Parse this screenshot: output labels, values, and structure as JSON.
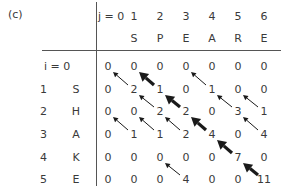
{
  "figure": {
    "panel_label": "(c)",
    "column_index_header": [
      "j = 0",
      "1",
      "2",
      "3",
      "4",
      "5",
      "6"
    ],
    "column_letters": [
      "",
      "S",
      "P",
      "E",
      "A",
      "R",
      "E"
    ],
    "row_index_labels": [
      "i = 0",
      "1",
      "2",
      "3",
      "4",
      "5"
    ],
    "row_letters": [
      "",
      "S",
      "H",
      "A",
      "K",
      "E"
    ],
    "matrix": [
      [
        0,
        0,
        0,
        0,
        0,
        0,
        0
      ],
      [
        0,
        2,
        1,
        0,
        1,
        0,
        0
      ],
      [
        0,
        0,
        2,
        2,
        0,
        3,
        1
      ],
      [
        0,
        1,
        1,
        2,
        4,
        0,
        4
      ],
      [
        0,
        0,
        0,
        0,
        0,
        7,
        0
      ],
      [
        0,
        0,
        0,
        4,
        0,
        0,
        11
      ]
    ],
    "arrows": [
      {
        "from": [
          1,
          1
        ],
        "to": [
          0,
          0
        ],
        "style": "thin"
      },
      {
        "from": [
          1,
          2
        ],
        "to": [
          0,
          1
        ],
        "style": "thick"
      },
      {
        "from": [
          1,
          4
        ],
        "to": [
          0,
          3
        ],
        "style": "thin"
      },
      {
        "from": [
          2,
          2
        ],
        "to": [
          1,
          1
        ],
        "style": "thin"
      },
      {
        "from": [
          2,
          3
        ],
        "to": [
          1,
          2
        ],
        "style": "thick"
      },
      {
        "from": [
          2,
          5
        ],
        "to": [
          1,
          4
        ],
        "style": "thin"
      },
      {
        "from": [
          2,
          6
        ],
        "to": [
          1,
          5
        ],
        "style": "thin"
      },
      {
        "from": [
          3,
          1
        ],
        "to": [
          2,
          0
        ],
        "style": "thin"
      },
      {
        "from": [
          3,
          2
        ],
        "to": [
          2,
          1
        ],
        "style": "thin"
      },
      {
        "from": [
          3,
          3
        ],
        "to": [
          2,
          2
        ],
        "style": "thin"
      },
      {
        "from": [
          3,
          4
        ],
        "to": [
          2,
          3
        ],
        "style": "thick"
      },
      {
        "from": [
          3,
          6
        ],
        "to": [
          2,
          5
        ],
        "style": "thin"
      },
      {
        "from": [
          4,
          5
        ],
        "to": [
          3,
          4
        ],
        "style": "thick"
      },
      {
        "from": [
          5,
          3
        ],
        "to": [
          4,
          2
        ],
        "style": "thin"
      },
      {
        "from": [
          5,
          6
        ],
        "to": [
          4,
          5
        ],
        "style": "thick"
      }
    ],
    "colors": {
      "text": "#3a3a3a",
      "lines": "#555555",
      "arrows": "#1a1a1a"
    }
  }
}
